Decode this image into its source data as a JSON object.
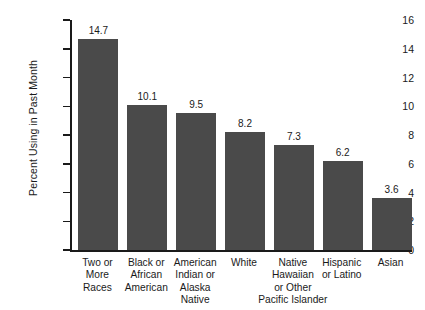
{
  "chart_data": {
    "type": "bar",
    "title": "",
    "subtitle": "",
    "xlabel": "",
    "ylabel": "Percent Using in Past Month",
    "ylim": [
      0,
      16
    ],
    "ytick_step": 2,
    "yticks": [
      "16",
      "14",
      "12",
      "10",
      "8",
      "6",
      "4",
      "2",
      "0"
    ],
    "grid": false,
    "legend": false,
    "bar_color": "#4a4a4a",
    "axis_color": "#1a1a1a",
    "background": "#ffffff",
    "categories": [
      "Two or\nMore\nRaces",
      "Black or\nAfrican\nAmerican",
      "American\nIndian or\nAlaska\nNative",
      "White",
      "Native\nHawaiian\nor Other\nPacific Islander",
      "Hispanic\nor Latino",
      "Asian"
    ],
    "values": [
      14.7,
      10.1,
      9.5,
      8.2,
      7.3,
      6.2,
      3.6
    ],
    "value_labels": [
      "14.7",
      "10.1",
      "9.5",
      "8.2",
      "7.3",
      "6.2",
      "3.6"
    ]
  }
}
